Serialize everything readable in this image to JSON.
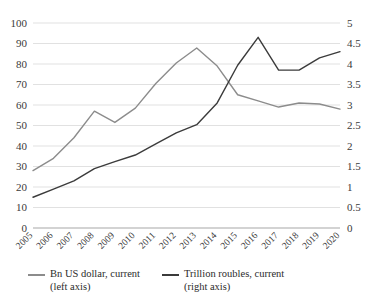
{
  "chart_data": {
    "type": "line",
    "title": "",
    "xlabel": "",
    "ylabel": "",
    "grid": true,
    "legend_position": "bottom-left",
    "categories": [
      "2005",
      "2006",
      "2007",
      "2008",
      "2009",
      "2010",
      "2011",
      "2012",
      "2013",
      "2014",
      "2015",
      "2016",
      "2017",
      "2018",
      "2019",
      "2020"
    ],
    "left_axis": {
      "label": "Bn US dollar, current (left axis)",
      "ylim": [
        0,
        100
      ],
      "ticks": [
        0,
        10,
        20,
        30,
        40,
        50,
        60,
        70,
        80,
        90,
        100
      ],
      "tick_labels": [
        "0",
        "10",
        "20",
        "30",
        "40",
        "50",
        "60",
        "70",
        "80",
        "90",
        "100"
      ]
    },
    "right_axis": {
      "label": "Trillion roubles, current (right axis)",
      "ylim": [
        0,
        5
      ],
      "ticks": [
        0,
        0.5,
        1,
        1.5,
        2,
        2.5,
        3,
        3.5,
        4,
        4.5,
        5
      ],
      "tick_labels": [
        "0",
        "0.5",
        "1",
        "1.5",
        "2",
        "2.5",
        "3",
        "3.5",
        "4",
        "4.5",
        "5"
      ]
    },
    "series": [
      {
        "name": "Bn US dollar, current",
        "axis": "left",
        "color": "#8c8c8c",
        "values": [
          28.0,
          34.0,
          44.0,
          57.0,
          51.5,
          58.5,
          70.5,
          80.5,
          87.8,
          79.0,
          65.0,
          62.0,
          59.0,
          61.0,
          60.5,
          58.0
        ]
      },
      {
        "name": "Trillion roubles, current",
        "axis": "right",
        "color": "#3b3b3b",
        "values": [
          0.75,
          0.95,
          1.15,
          1.45,
          1.62,
          1.78,
          2.05,
          2.32,
          2.52,
          3.05,
          3.97,
          4.65,
          3.85,
          3.85,
          4.15,
          4.3
        ]
      }
    ]
  },
  "legend": {
    "items": [
      {
        "line1": "Bn US dollar, current",
        "line2": "(left axis)",
        "swatch": "legend-line-grey"
      },
      {
        "line1": "Trillion roubles, current",
        "line2": "(right axis)",
        "swatch": "legend-line-dark"
      }
    ]
  },
  "colors": {
    "series_left": "#8c8c8c",
    "series_right": "#3b3b3b",
    "grid": "#d9d9d9",
    "axis_text": "#3a3a3a",
    "background": "#ffffff"
  }
}
